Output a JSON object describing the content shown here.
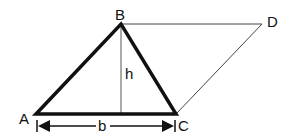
{
  "diagram": {
    "points": {
      "A": {
        "label": "A",
        "x": 36,
        "y": 114
      },
      "B": {
        "label": "B",
        "x": 121,
        "y": 24
      },
      "C": {
        "label": "C",
        "x": 176,
        "y": 114
      },
      "D": {
        "label": "D",
        "x": 262,
        "y": 24
      }
    },
    "height_label": "h",
    "base_label": "b",
    "colors": {
      "stroke": "#111111",
      "thin_stroke": "#333333",
      "background": "#ffffff"
    }
  }
}
